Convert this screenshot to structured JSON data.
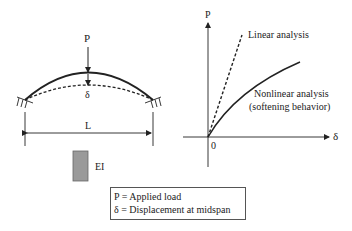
{
  "beam": {
    "load_label": "P",
    "deflection_label": "δ",
    "span_label": "L",
    "section_label": "EI"
  },
  "graph": {
    "y_axis_label": "P",
    "x_axis_label": "δ",
    "origin_label": "0",
    "linear_label": "Linear analysis",
    "nonlinear_label_line1": "Nonlinear analysis",
    "nonlinear_label_line2": "(softening behavior)"
  },
  "legend": {
    "line1": "P = Applied load",
    "line2": "δ = Displacement at midspan"
  },
  "colors": {
    "line": "#222222",
    "section_fill": "#9a9a9a"
  }
}
